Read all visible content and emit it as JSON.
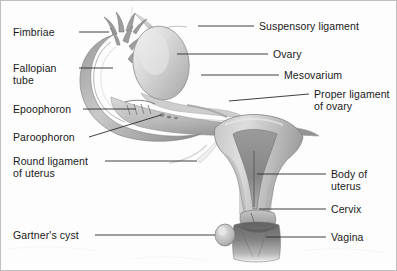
{
  "figure": {
    "width": 397,
    "height": 271,
    "background_color": "#fdfdfd",
    "border_color": "#bfbfbf",
    "leader_line_color": "#2b2b2b",
    "text_color": "#1a1a1a"
  },
  "labels_left": [
    {
      "id": "fimbriae",
      "text": "Fimbriae",
      "x": 12,
      "y": 26,
      "line": {
        "x1": 78,
        "y1": 31,
        "x2": 108,
        "y2": 31
      }
    },
    {
      "id": "fallopian-tube",
      "text": "Fallopian",
      "text2": "tube",
      "x": 12,
      "y": 62,
      "line": {
        "x1": 78,
        "y1": 67,
        "x2": 112,
        "y2": 67
      }
    },
    {
      "id": "epoophoron",
      "text": "Epoophoron",
      "x": 12,
      "y": 103,
      "line": {
        "x1": 82,
        "y1": 108,
        "x2": 135,
        "y2": 108
      }
    },
    {
      "id": "paroophoron",
      "text": "Paroophoron",
      "x": 12,
      "y": 131,
      "line": {
        "x1": 88,
        "y1": 136,
        "x2": 160,
        "y2": 114
      }
    },
    {
      "id": "round-ligament",
      "text": "Round ligament",
      "text2": "of uterus",
      "x": 12,
      "y": 155,
      "line": {
        "x1": 104,
        "y1": 160,
        "x2": 196,
        "y2": 160
      }
    },
    {
      "id": "gartners-cyst",
      "text": "Gartner's cyst",
      "x": 12,
      "y": 229,
      "line": {
        "x1": 94,
        "y1": 234,
        "x2": 214,
        "y2": 234
      }
    }
  ],
  "labels_right": [
    {
      "id": "suspensory-ligament",
      "text": "Suspensory ligament",
      "x": 258,
      "y": 20,
      "line": {
        "x1": 197,
        "y1": 25,
        "x2": 253,
        "y2": 25
      }
    },
    {
      "id": "ovary",
      "text": "Ovary",
      "x": 272,
      "y": 48,
      "line": {
        "x1": 176,
        "y1": 53,
        "x2": 267,
        "y2": 53
      }
    },
    {
      "id": "mesovarium",
      "text": "Mesovarium",
      "x": 283,
      "y": 69,
      "line": {
        "x1": 200,
        "y1": 74,
        "x2": 278,
        "y2": 74
      }
    },
    {
      "id": "proper-ligament-ovary",
      "text": "Proper ligament",
      "text2": "of ovary",
      "x": 313,
      "y": 88,
      "line": {
        "x1": 228,
        "y1": 100,
        "x2": 308,
        "y2": 93
      }
    },
    {
      "id": "body-of-uterus",
      "text": "Body of",
      "text2": "uterus",
      "x": 330,
      "y": 168,
      "line": {
        "x1": 256,
        "y1": 173,
        "x2": 325,
        "y2": 173
      }
    },
    {
      "id": "cervix",
      "text": "Cervix",
      "x": 330,
      "y": 203,
      "line": {
        "x1": 258,
        "y1": 208,
        "x2": 325,
        "y2": 208
      }
    },
    {
      "id": "vagina",
      "text": "Vagina",
      "x": 330,
      "y": 231,
      "line": {
        "x1": 265,
        "y1": 236,
        "x2": 325,
        "y2": 236
      }
    }
  ],
  "anatomy_parts": [
    {
      "id": "fimbriae",
      "name": "fimbriae"
    },
    {
      "id": "fallopian-tube",
      "name": "fallopian-tube"
    },
    {
      "id": "ovary",
      "name": "ovary"
    },
    {
      "id": "mesovarium",
      "name": "mesovarium"
    },
    {
      "id": "broad-ligament",
      "name": "broad-ligament"
    },
    {
      "id": "uterus-body",
      "name": "uterus-body"
    },
    {
      "id": "endometrial-cavity",
      "name": "endometrial-cavity"
    },
    {
      "id": "cervix",
      "name": "cervix"
    },
    {
      "id": "vagina",
      "name": "vagina"
    },
    {
      "id": "gartners-cyst",
      "name": "gartners-cyst"
    },
    {
      "id": "round-ligament",
      "name": "round-ligament"
    },
    {
      "id": "suspensory-ligament",
      "name": "suspensory-ligament"
    },
    {
      "id": "epoophoron",
      "name": "epoophoron"
    },
    {
      "id": "paroophoron",
      "name": "paroophoron"
    }
  ],
  "palette": {
    "tissue_light": "#dcdcdc",
    "tissue_mid": "#b9b9b9",
    "tissue_dark": "#8e8e8e",
    "tissue_darkest": "#6a6a6a",
    "outline": "#7a7a7a",
    "highlight": "#efefef"
  }
}
